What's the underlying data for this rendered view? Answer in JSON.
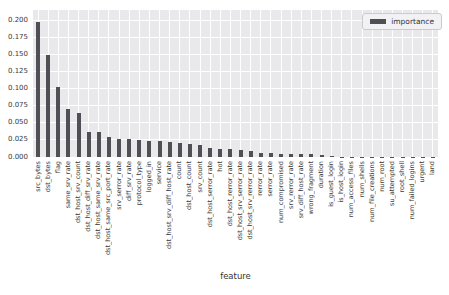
{
  "chart_data": {
    "type": "bar",
    "title": "",
    "xlabel": "feature",
    "ylabel": "",
    "legend": {
      "label": "importance",
      "position": "upper right"
    },
    "grid": true,
    "ylim": [
      0,
      0.2156
    ],
    "yticks": [
      0.0,
      0.025,
      0.05,
      0.075,
      0.1,
      0.125,
      0.15,
      0.175,
      0.2
    ],
    "ytick_labels": [
      "0.000",
      "0.025",
      "0.050",
      "0.075",
      "0.100",
      "0.125",
      "0.150",
      "0.175",
      "0.200"
    ],
    "categories": [
      "src_bytes",
      "dst_bytes",
      "flag",
      "same_srv_rate",
      "dst_host_srv_count",
      "dst_host_diff_srv_rate",
      "dst_host_same_srv_rate",
      "dst_host_same_src_port_rate",
      "srv_serror_rate",
      "diff_srv_rate",
      "protocol_type",
      "logged_in",
      "service",
      "dst_host_srv_diff_host_rate",
      "count",
      "dst_host_count",
      "srv_count",
      "dst_host_serror_rate",
      "hot",
      "dst_host_rerror_rate",
      "dst_host_srv_serror_rate",
      "dst_host_srv_rerror_rate",
      "rerror_rate",
      "serror_rate",
      "num_compromised",
      "srv_rerror_rate",
      "srv_diff_host_rate",
      "wrong_fragment",
      "duration",
      "is_guest_login",
      "is_host_login",
      "num_access_files",
      "num_shells",
      "num_file_creations",
      "num_root",
      "su_attempted",
      "root_shell",
      "num_failed_logins",
      "urgent",
      "land"
    ],
    "values": [
      0.198,
      0.15,
      0.102,
      0.07,
      0.065,
      0.037,
      0.036,
      0.03,
      0.027,
      0.026,
      0.025,
      0.024,
      0.023,
      0.022,
      0.021,
      0.019,
      0.017,
      0.013,
      0.012,
      0.012,
      0.011,
      0.009,
      0.006,
      0.006,
      0.005,
      0.005,
      0.0045,
      0.004,
      0.0035,
      0.0008,
      0.0005,
      0.0004,
      0.0004,
      0.0003,
      0.0003,
      0.0002,
      0.0002,
      0.0001,
      0.0001,
      0.0001
    ],
    "colors": {
      "bar": "#4f4f55",
      "plot_background": "#e9e9ec",
      "gridline": "#ffffff",
      "tick_text": "#3a3a3a",
      "figure_background": "#ffffff"
    }
  }
}
